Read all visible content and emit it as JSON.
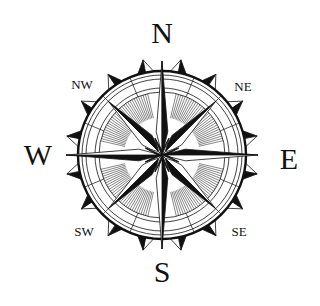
{
  "compass": {
    "center": [
      162,
      155
    ],
    "colors": {
      "ink": "#111111",
      "paper": "#ffffff"
    },
    "labels": {
      "cardinal": [
        {
          "key": "N",
          "text": "N",
          "x": 162,
          "y": 33
        },
        {
          "key": "E",
          "text": "E",
          "x": 289,
          "y": 159
        },
        {
          "key": "S",
          "text": "S",
          "x": 162,
          "y": 272
        },
        {
          "key": "W",
          "text": "W",
          "x": 38,
          "y": 155
        }
      ],
      "intercardinal": [
        {
          "key": "NE",
          "text": "NE",
          "x": 243,
          "y": 86
        },
        {
          "key": "SE",
          "text": "SE",
          "x": 239,
          "y": 231
        },
        {
          "key": "SW",
          "text": "SW",
          "x": 84,
          "y": 231
        },
        {
          "key": "NW",
          "text": "NW",
          "x": 82,
          "y": 84
        }
      ]
    }
  }
}
